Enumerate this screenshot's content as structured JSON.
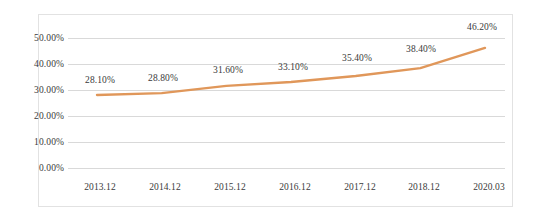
{
  "chart_data": {
    "type": "line",
    "title": "",
    "subtitle": "",
    "xlabel": "",
    "ylabel": "",
    "categories": [
      "2013.12",
      "2014.12",
      "2015.12",
      "2016.12",
      "2017.12",
      "2018.12",
      "2020.03"
    ],
    "values": [
      28.1,
      28.8,
      31.6,
      33.1,
      35.4,
      38.4,
      46.2
    ],
    "data_labels": [
      "28.10%",
      "28.80%",
      "31.60%",
      "33.10%",
      "35.40%",
      "38.40%",
      "46.20%"
    ],
    "ylim": [
      0,
      50
    ],
    "ytick_values": [
      0,
      10,
      20,
      30,
      40,
      50
    ],
    "ytick_labels": [
      "0.00%",
      "10.00%",
      "20.00%",
      "30.00%",
      "40.00%",
      "50.00%"
    ],
    "grid": true,
    "grid_axis": "y",
    "legend": false,
    "legend_position": "none",
    "markers": false,
    "series": [
      {
        "name": "",
        "color": "#E0975A",
        "values": [
          28.1,
          28.8,
          31.6,
          33.1,
          35.4,
          38.4,
          46.2
        ]
      }
    ]
  },
  "style": {
    "line_color": "#E0975A",
    "grid_color": "#d9d9d9",
    "frame_color": "#e2e2e2",
    "text_color": "#3a3a3a",
    "background": "#ffffff"
  }
}
